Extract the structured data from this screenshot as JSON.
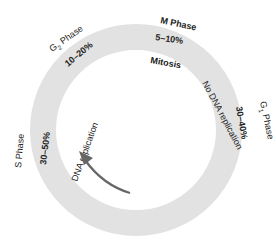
{
  "diagram": {
    "ring": {
      "center": [
        136,
        130
      ],
      "outer_radius": 106,
      "inner_radius": 80,
      "fill_color": "#e2e2e2",
      "background_color": "#ffffff"
    },
    "phases": [
      {
        "id": "m",
        "name": "M Phase",
        "name_main": "M Phase",
        "duration": "5–10%",
        "note": "Mitosis"
      },
      {
        "id": "g1",
        "name": "G1 Phase",
        "name_main": "G",
        "name_sub": "1",
        "name_rest": " Phase",
        "duration": "30–40%",
        "note": "No DNA replication"
      },
      {
        "id": "s",
        "name": "S Phase",
        "name_main": "S Phase",
        "duration": "30–50%",
        "note": "DNA replication"
      },
      {
        "id": "g2",
        "name": "G2 Phase",
        "name_main": "G",
        "name_sub": "2",
        "name_rest": " Phase",
        "duration": "10–20%"
      }
    ],
    "arrow": {
      "direction": "counterclockwise",
      "color": "#666666"
    },
    "text_color": "#222222"
  }
}
